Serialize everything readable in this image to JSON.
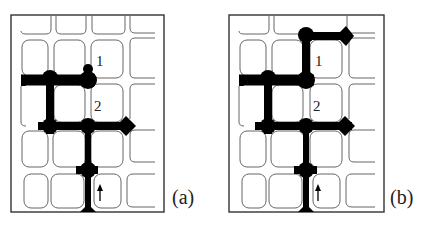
{
  "panels": [
    {
      "id": "a",
      "label": "(a)",
      "cell_labels": [
        "1",
        "2"
      ],
      "arrow": "up-arrow"
    },
    {
      "id": "b",
      "label": "(b)",
      "cell_labels": [
        "1",
        "2"
      ],
      "arrow": "up-arrow"
    }
  ],
  "colors": {
    "channel": "#000000",
    "cell_outline": "#666666",
    "frame": "#333333"
  }
}
